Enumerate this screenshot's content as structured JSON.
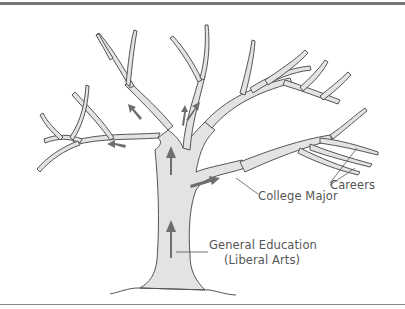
{
  "diagram": {
    "type": "metaphor-tree",
    "labels": {
      "careers": "Careers",
      "college_major": "College Major",
      "general_education": "General Education",
      "liberal_arts": "(Liberal Arts)"
    },
    "colors": {
      "trunk_fill": "#e3e3e3",
      "outline": "#555555",
      "arrow": "#6e6e6e",
      "rule": "#777777"
    },
    "arrows": [
      {
        "location": "lower-trunk",
        "direction": "up"
      },
      {
        "location": "upper-trunk",
        "direction": "up"
      },
      {
        "location": "right-branch",
        "direction": "right"
      },
      {
        "location": "upper-right-limb",
        "direction": "up-right"
      },
      {
        "location": "upper-center-limb",
        "direction": "up"
      },
      {
        "location": "upper-left-limb",
        "direction": "up-left"
      },
      {
        "location": "left-branch",
        "direction": "left"
      }
    ]
  }
}
